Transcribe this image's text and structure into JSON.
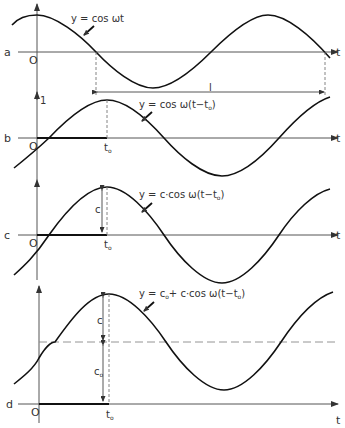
{
  "figure": {
    "panels": [
      {
        "id": "a",
        "label": "a",
        "equation": "y = cos ωt",
        "origin_label": "O",
        "axis_label": "t",
        "period_label": "l"
      },
      {
        "id": "b",
        "label": "b",
        "equation_prefix": "y = cos ω(t−t",
        "equation_sub": "o",
        "equation_suffix": ")",
        "origin_label": "O",
        "axis_label": "t",
        "y_tick_label": "1",
        "t0_main": "t",
        "t0_sub": "o"
      },
      {
        "id": "c",
        "label": "c",
        "equation_prefix": "y = c·cos ω(t−t",
        "equation_sub": "o",
        "equation_suffix": ")",
        "origin_label": "O",
        "axis_label": "t",
        "amplitude_label": "c",
        "t0_main": "t",
        "t0_sub": "o"
      },
      {
        "id": "d",
        "label": "d",
        "equation_p1": "y = c",
        "equation_p1_sub": "o",
        "equation_p2": "+ c·cos ω(t−t",
        "equation_p2_sub": "o",
        "equation_p3": ")",
        "origin_label": "O",
        "axis_label": "t",
        "amplitude_label": "c",
        "offset_main": "c",
        "offset_sub": "o",
        "t0_main": "t",
        "t0_sub": "o"
      }
    ]
  }
}
